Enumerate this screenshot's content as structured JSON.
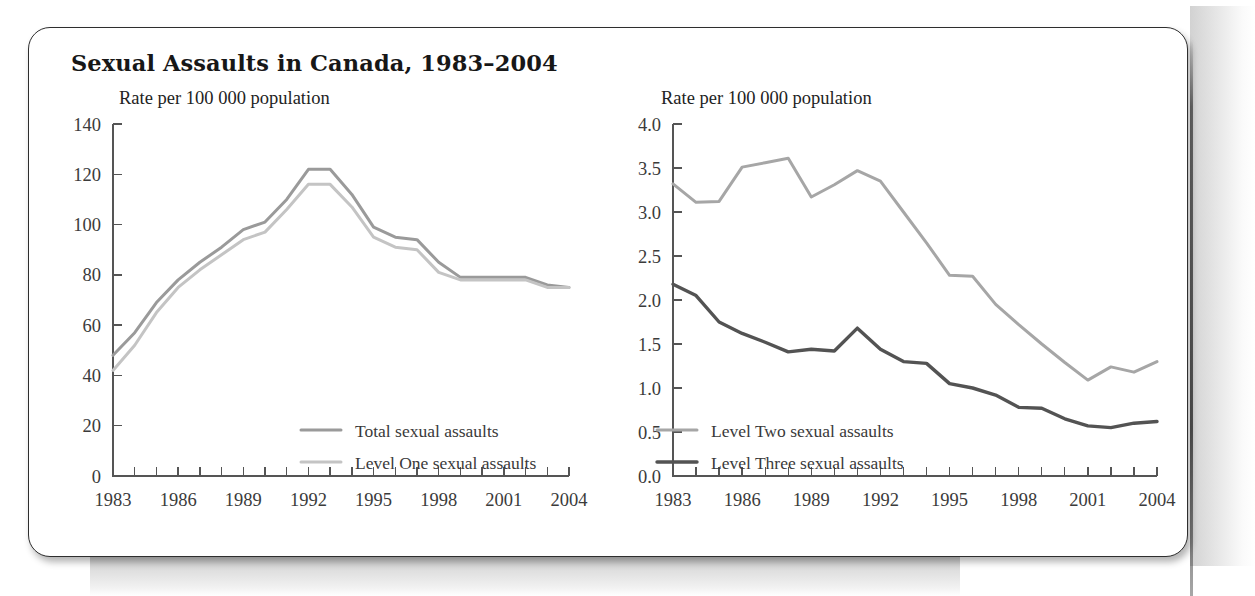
{
  "figure": {
    "title": "Sexual Assaults in Canada, 1983–2004",
    "frame_color": "#2e2e2e",
    "background_color": "#ffffff"
  },
  "colors": {
    "total_sexual_assaults": "#9a9a9a",
    "level_one_sexual_assaults": "#c4c4c4",
    "level_two_sexual_assaults": "#a6a6a6",
    "level_three_sexual_assaults": "#535353",
    "axis": "#555555",
    "text": "#3b3b3b"
  },
  "chart_data": [
    {
      "id": "left-chart",
      "type": "line",
      "title": "",
      "ylabel": "Rate per 100 000 population",
      "xlabel": "",
      "ylim": [
        0,
        140
      ],
      "yticks": [
        0,
        20,
        40,
        60,
        80,
        100,
        120,
        140
      ],
      "ytick_labels": [
        "0",
        "20",
        "40",
        "60",
        "80",
        "100",
        "120",
        "140"
      ],
      "xlim": [
        1983,
        2004
      ],
      "x": [
        1983,
        1984,
        1985,
        1986,
        1987,
        1988,
        1989,
        1990,
        1991,
        1992,
        1993,
        1994,
        1995,
        1996,
        1997,
        1998,
        1999,
        2000,
        2001,
        2002,
        2003,
        2004
      ],
      "xticks": [
        1983,
        1984,
        1985,
        1986,
        1987,
        1988,
        1989,
        1990,
        1991,
        1992,
        1993,
        1994,
        1995,
        1996,
        1997,
        1998,
        1999,
        2000,
        2001,
        2002,
        2003,
        2004
      ],
      "xtick_labels": [
        "1983",
        "",
        "",
        "1986",
        "",
        "",
        "1989",
        "",
        "",
        "1992",
        "",
        "",
        "1995",
        "",
        "",
        "1998",
        "",
        "",
        "2001",
        "",
        "",
        "2004"
      ],
      "grid": false,
      "legend_position": "lower-right",
      "series": [
        {
          "name": "Total sexual assaults",
          "color": "#9a9a9a",
          "width": 3.0,
          "values": [
            48,
            57,
            69,
            78,
            85,
            91,
            98,
            101,
            110,
            122,
            122,
            112,
            99,
            95,
            94,
            85,
            79,
            79,
            79,
            79,
            76,
            75
          ]
        },
        {
          "name": "Level One sexual assaults",
          "color": "#c4c4c4",
          "width": 3.0,
          "values": [
            42,
            52,
            65,
            75,
            82,
            88,
            94,
            97,
            106,
            116,
            116,
            107,
            95,
            91,
            90,
            81,
            78,
            78,
            78,
            78,
            75,
            75
          ]
        }
      ]
    },
    {
      "id": "right-chart",
      "type": "line",
      "title": "",
      "ylabel": "Rate per 100 000 population",
      "xlabel": "",
      "ylim": [
        0.0,
        4.0
      ],
      "yticks": [
        0.0,
        0.5,
        1.0,
        1.5,
        2.0,
        2.5,
        3.0,
        3.5,
        4.0
      ],
      "ytick_labels": [
        "0.0",
        "0.5",
        "1.0",
        "1.5",
        "2.0",
        "2.5",
        "3.0",
        "3.5",
        "4.0"
      ],
      "xlim": [
        1983,
        2004
      ],
      "x": [
        1983,
        1984,
        1985,
        1986,
        1987,
        1988,
        1989,
        1990,
        1991,
        1992,
        1993,
        1994,
        1995,
        1996,
        1997,
        1998,
        1999,
        2000,
        2001,
        2002,
        2003,
        2004
      ],
      "xticks": [
        1983,
        1984,
        1985,
        1986,
        1987,
        1988,
        1989,
        1990,
        1991,
        1992,
        1993,
        1994,
        1995,
        1996,
        1997,
        1998,
        1999,
        2000,
        2001,
        2002,
        2003,
        2004
      ],
      "xtick_labels": [
        "1983",
        "",
        "",
        "1986",
        "",
        "",
        "1989",
        "",
        "",
        "1992",
        "",
        "",
        "1995",
        "",
        "",
        "1998",
        "",
        "",
        "2001",
        "",
        "",
        "2004"
      ],
      "grid": false,
      "legend_position": "lower-left",
      "series": [
        {
          "name": "Level Two sexual assaults",
          "color": "#a6a6a6",
          "width": 3.0,
          "values": [
            3.32,
            3.11,
            3.12,
            3.51,
            3.56,
            3.61,
            3.17,
            3.31,
            3.47,
            3.35,
            3.0,
            2.65,
            2.28,
            2.27,
            1.95,
            1.72,
            1.5,
            1.29,
            1.09,
            1.24,
            1.18,
            1.3
          ]
        },
        {
          "name": "Level Three sexual assaults",
          "color": "#535353",
          "width": 3.4,
          "values": [
            2.18,
            2.05,
            1.75,
            1.62,
            1.52,
            1.41,
            1.44,
            1.42,
            1.68,
            1.44,
            1.3,
            1.28,
            1.05,
            1.0,
            0.92,
            0.78,
            0.77,
            0.65,
            0.57,
            0.55,
            0.6,
            0.62
          ]
        }
      ]
    }
  ]
}
